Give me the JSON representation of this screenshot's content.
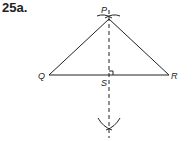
{
  "problem": {
    "number": "25a."
  },
  "figure": {
    "points": {
      "P": {
        "label": "P",
        "x": 109,
        "y": 19
      },
      "Q": {
        "label": "Q",
        "x": 49,
        "y": 75
      },
      "R": {
        "label": "R",
        "x": 169,
        "y": 75
      },
      "S": {
        "label": "S",
        "x": 109,
        "y": 75
      }
    },
    "stroke_color": "#222222",
    "perpendicular_bisector": "dashed line through P and S",
    "right_angle_marker": "at S"
  }
}
